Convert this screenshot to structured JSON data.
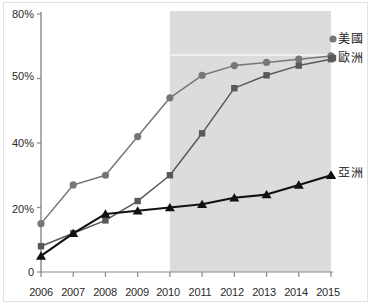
{
  "chart_data": {
    "type": "line",
    "title": "",
    "xlabel": "",
    "ylabel": "",
    "grid": false,
    "legend_position": "right-inline-labels",
    "categories": [
      "2006",
      "2007",
      "2008",
      "2009",
      "2010",
      "2011",
      "2012",
      "2013",
      "2014",
      "2015"
    ],
    "x": [
      2006,
      2007,
      2008,
      2009,
      2010,
      2011,
      2012,
      2013,
      2014,
      2015
    ],
    "ytick_labels": [
      "80%",
      "50%",
      "40%",
      "20%",
      "0"
    ],
    "ytick_values": [
      80,
      60,
      40,
      20,
      0
    ],
    "ylim": [
      0,
      80
    ],
    "xlim": [
      2006,
      2015
    ],
    "unit": "%",
    "shaded_band": {
      "from": "2010",
      "to": "2015",
      "color": "#dcdcdc"
    },
    "series": [
      {
        "name": "美國",
        "marker": "circle",
        "color": "#777777",
        "values": [
          15,
          27,
          30,
          42,
          54,
          61,
          64,
          65,
          66,
          67
        ]
      },
      {
        "name": "歐洲",
        "marker": "square",
        "color": "#595959",
        "values": [
          8,
          12,
          16,
          22,
          30,
          43,
          57,
          61,
          64,
          66
        ]
      },
      {
        "name": "亞洲",
        "marker": "triangle",
        "color": "#111111",
        "values": [
          5,
          12,
          18,
          19,
          20,
          21,
          23,
          24,
          27,
          30
        ]
      }
    ]
  },
  "axes": {
    "y_labels": [
      {
        "text": "80%",
        "value": 80
      },
      {
        "text": "50%",
        "value": 60
      },
      {
        "text": "40%",
        "value": 40
      },
      {
        "text": "20%",
        "value": 20
      },
      {
        "text": "0",
        "value": 0
      }
    ],
    "x_labels": [
      "2006",
      "2007",
      "2008",
      "2009",
      "2010",
      "2011",
      "2012",
      "2013",
      "2014",
      "2015"
    ]
  },
  "legend": {
    "items": [
      {
        "label": "美國",
        "marker": "circle",
        "color": "#777777"
      },
      {
        "label": "歐洲",
        "marker": "square",
        "color": "#595959"
      },
      {
        "label": "亞洲",
        "marker": "triangle",
        "color": "#111111"
      }
    ]
  },
  "colors": {
    "us_line": "#777777",
    "europe_line": "#595959",
    "asia_line": "#111111",
    "band": "#dcdcdc",
    "axis": "#888888",
    "text": "#2a2a2a",
    "frame": "#e2e2e2"
  }
}
